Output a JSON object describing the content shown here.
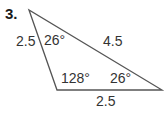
{
  "problem": {
    "number": "3."
  },
  "triangle": {
    "vertices": {
      "top": [
        29,
        10
      ],
      "bottom_left": [
        57,
        90
      ],
      "right": [
        162,
        90
      ]
    },
    "sides": {
      "left": "2.5",
      "hypotenuse": "4.5",
      "bottom": "2.5"
    },
    "angles": {
      "top": "26°",
      "bottom_left": "128°",
      "right": "26°"
    },
    "stroke_color": "#555555"
  }
}
